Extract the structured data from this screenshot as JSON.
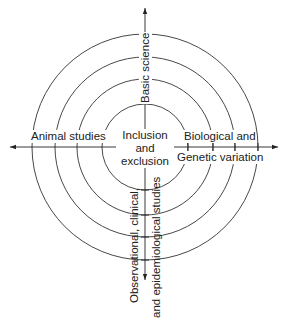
{
  "diagram": {
    "center_label": [
      "Inclusion",
      "and",
      "exclusion"
    ],
    "left_label": "Animal studies",
    "right_label_1": "Biological and",
    "right_label_2": "Genetic variation",
    "top_label": "Basic science",
    "bottom_label_1": "Observational, clinical,",
    "bottom_label_2": "and epidemiological studies",
    "rings": 4,
    "line_color": "#222222"
  }
}
